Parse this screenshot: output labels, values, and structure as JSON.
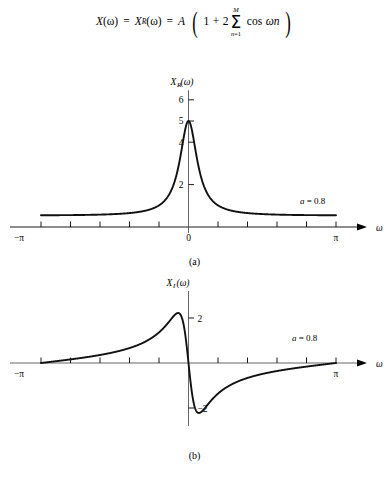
{
  "equation": {
    "full_text": "X(ω) = X_R(ω) = A (1 + 2 Σ_{n=1}^{M} cos ωn)",
    "lhs1": "X",
    "lhs1_arg": "(ω)",
    "eq1": "=",
    "lhs2": "X",
    "lhs2_sub": "R",
    "lhs2_arg": "(ω)",
    "eq2": "=",
    "amplitude": "A",
    "open_paren": "(",
    "one": "1",
    "plus": "+",
    "two": "2",
    "sigma": "Σ",
    "sigma_upper": "M",
    "sigma_lower_var": "n",
    "sigma_lower_eq": "=1",
    "cos": "cos",
    "cos_arg": "ωn",
    "close_paren": ")"
  },
  "figure_a": {
    "caption": "(a)",
    "ylabel_main": "X",
    "ylabel_sub": "R",
    "ylabel_arg": "(ω)",
    "xlabel": "ω",
    "annotation": "a = 0.8",
    "annotation_var": "a",
    "annotation_rest": " = 0.8",
    "ytick_labels": [
      "6",
      "5",
      "4",
      "2"
    ],
    "xtick_labels": [
      "−π",
      "0",
      "π"
    ]
  },
  "figure_b": {
    "caption": "(b)",
    "ylabel_main": "X",
    "ylabel_sub": "I",
    "ylabel_arg": "(ω)",
    "xlabel": "ω",
    "annotation": "a = 0.8",
    "annotation_var": "a",
    "annotation_rest": " = 0.8",
    "ytick_labels": [
      "2",
      "−2"
    ],
    "xtick_labels": [
      "−π",
      "0",
      "π"
    ]
  },
  "chart_data": [
    {
      "id": "figure-a",
      "type": "line",
      "title": "X_R(ω)",
      "subtitle": "(a)",
      "xlabel": "ω",
      "ylabel": "X_R(ω)",
      "parameter": "a = 0.8",
      "a": 0.8,
      "formula": "X_R(ω) = (1 - a*cos(ω)) / (1 - 2*a*cos(ω) + a^2)",
      "xlim": [
        -3.14159265,
        3.14159265
      ],
      "ylim": [
        0,
        6.4
      ],
      "xticks": [
        -3.14159265,
        -2.5132741,
        -1.88495559,
        -1.25663706,
        -0.62831853,
        0,
        0.62831853,
        1.25663706,
        1.88495559,
        2.5132741,
        3.14159265
      ],
      "xtick_labels": [
        "−π",
        "",
        "",
        "",
        "",
        "0",
        "",
        "",
        "",
        "",
        "π"
      ],
      "yticks": [
        2,
        4,
        5,
        6
      ],
      "ytick_labels": [
        "2",
        "4",
        "5",
        "6"
      ],
      "grid": false,
      "legend": false,
      "x": [
        -3.14159265,
        -2.98451302,
        -2.82743339,
        -2.67035376,
        -2.51327412,
        -2.35619449,
        -2.19911486,
        -2.04203522,
        -1.88495559,
        -1.72787596,
        -1.57079633,
        -1.41371669,
        -1.25663706,
        -1.09955743,
        -0.9424778,
        -0.78539816,
        -0.62831853,
        -0.4712389,
        -0.31415927,
        -0.15707963,
        0,
        0.15707963,
        0.31415927,
        0.4712389,
        0.62831853,
        0.78539816,
        0.9424778,
        1.09955743,
        1.25663706,
        1.41371669,
        1.57079633,
        1.72787596,
        1.88495559,
        2.04203522,
        2.19911486,
        2.35619449,
        2.51327412,
        2.67035376,
        2.82743339,
        2.98451302,
        3.14159265
      ],
      "y": [
        0.5556,
        0.5575,
        0.5633,
        0.5733,
        0.5878,
        0.6073,
        0.6327,
        0.6649,
        0.7055,
        0.7563,
        0.8197,
        0.8992,
        0.999,
        1.125,
        1.285,
        1.491,
        1.758,
        2.109,
        2.572,
        3.157,
        3.786,
        4.257,
        4.445,
        4.378,
        4.164,
        3.879,
        3.57,
        3.261,
        2.966,
        2.692,
        2.44,
        2.212,
        2.007,
        1.823,
        1.658,
        1.512,
        1.381,
        1.265,
        1.163,
        1.072,
        0.9919
      ],
      "peak": {
        "x": 0,
        "y": 5.0,
        "note": "value at ω=0 is 5"
      },
      "value_at_pi": 0.5556
    },
    {
      "id": "figure-b",
      "type": "line",
      "title": "X_I(ω)",
      "subtitle": "(b)",
      "xlabel": "ω",
      "ylabel": "X_I(ω)",
      "parameter": "a = 0.8",
      "a": 0.8,
      "formula": "X_I(ω) = -a*sin(ω) / (1 - 2*a*cos(ω) + a^2)",
      "xlim": [
        -3.14159265,
        3.14159265
      ],
      "ylim": [
        -2.6,
        2.6
      ],
      "xticks": [
        -3.14159265,
        -2.5132741,
        -1.88495559,
        -1.25663706,
        -0.62831853,
        0,
        0.62831853,
        1.25663706,
        1.88495559,
        2.5132741,
        3.14159265
      ],
      "xtick_labels": [
        "−π",
        "",
        "",
        "",
        "",
        "0",
        "",
        "",
        "",
        "",
        "π"
      ],
      "yticks": [
        2,
        -2
      ],
      "ytick_labels": [
        "2",
        "−2"
      ],
      "grid": false,
      "legend": false,
      "max": {
        "x": -0.6435,
        "y": 2.2222
      },
      "min": {
        "x": 0.6435,
        "y": -2.2222
      },
      "zero_crossings": [
        -3.14159265,
        0,
        3.14159265
      ]
    }
  ]
}
